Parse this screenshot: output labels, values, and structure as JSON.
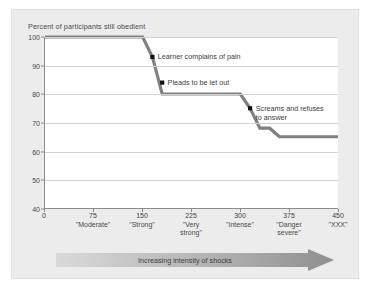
{
  "panel": {
    "background": "#ececec"
  },
  "chart_data": {
    "type": "line",
    "title": "Percent of participants still obedient",
    "xlabel": "Increasing intensity of shocks",
    "ylabel": "Percent of participants still obedient",
    "xlim": [
      0,
      450
    ],
    "ylim": [
      40,
      100
    ],
    "grid": true,
    "legend": "none",
    "line_color": "#808080",
    "marker_color": "#111111",
    "y_ticks": [
      100,
      90,
      80,
      70,
      60,
      50,
      40
    ],
    "x_ticks": [
      {
        "value": 0,
        "num": "0",
        "name": ""
      },
      {
        "value": 75,
        "num": "75",
        "name": "\"Moderate\""
      },
      {
        "value": 150,
        "num": "150",
        "name": "\"Strong\""
      },
      {
        "value": 225,
        "num": "225",
        "name": "\"Very\nstrong\""
      },
      {
        "value": 300,
        "num": "300",
        "name": "\"Intense\""
      },
      {
        "value": 375,
        "num": "375",
        "name": "\"Danger\nsevere\""
      },
      {
        "value": 450,
        "num": "450",
        "name": "\"XXX\""
      }
    ],
    "x": [
      0,
      150,
      165,
      180,
      300,
      315,
      330,
      345,
      360,
      450
    ],
    "y": [
      100,
      100,
      93,
      80,
      80,
      75,
      68,
      68,
      65,
      65
    ],
    "points": [
      {
        "x": 0,
        "y": 100
      },
      {
        "x": 150,
        "y": 100
      },
      {
        "x": 165,
        "y": 93
      },
      {
        "x": 180,
        "y": 80
      },
      {
        "x": 300,
        "y": 80
      },
      {
        "x": 315,
        "y": 75
      },
      {
        "x": 330,
        "y": 68
      },
      {
        "x": 345,
        "y": 68
      },
      {
        "x": 360,
        "y": 65
      },
      {
        "x": 450,
        "y": 65
      }
    ],
    "markers": [
      {
        "x": 165,
        "y": 93,
        "label": "Learner complains of pain"
      },
      {
        "x": 180,
        "y": 84,
        "label": "Pleads to be let out"
      },
      {
        "x": 315,
        "y": 75,
        "label": "Screams and refuses\nto answer"
      }
    ],
    "annotations": [
      {
        "text": "Learner complains of pain",
        "x": 165,
        "y": 93
      },
      {
        "text": "Pleads to be let out",
        "x": 180,
        "y": 84
      },
      {
        "text": "Screams and refuses\nto answer",
        "x": 315,
        "y": 75
      }
    ]
  },
  "axis_banner": {
    "label": "Increasing intensity of shocks"
  }
}
